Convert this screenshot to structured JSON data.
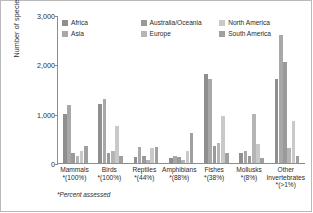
{
  "chart_data": {
    "type": "bar",
    "title": "",
    "xlabel": "",
    "ylabel": "Number of species threatened",
    "ylim": [
      0,
      3000
    ],
    "yticks": [
      "0",
      "1,000",
      "2,000",
      "3,000"
    ],
    "ytick_values": [
      0,
      1000,
      2000,
      3000
    ],
    "grid": false,
    "legend_position": "top-inside",
    "footnote": "*Percent assessed",
    "categories": [
      "Mammals",
      "Birds",
      "Reptiles",
      "Amphibians",
      "Fishes",
      "Mollusks",
      "Other Invertebrates"
    ],
    "category_percents": [
      "*(100%)",
      "*(100%)",
      "*(44%)",
      "*(88%)",
      "*(38%)",
      "*(8%)",
      "*(>1%)"
    ],
    "series": [
      {
        "name": "Africa",
        "color": "#8f8f8f",
        "values": [
          1000,
          1200,
          120,
          110,
          1800,
          210,
          1700
        ]
      },
      {
        "name": "Asia",
        "color": "#a8a8a8",
        "values": [
          1180,
          1300,
          330,
          150,
          1700,
          240,
          2600
        ]
      },
      {
        "name": "Australia/Oceania",
        "color": "#9a9a9a",
        "values": [
          200,
          210,
          140,
          120,
          350,
          150,
          2050
        ]
      },
      {
        "name": "Europe",
        "color": "#b5b5b5",
        "values": [
          150,
          250,
          70,
          60,
          400,
          1000,
          300
        ]
      },
      {
        "name": "North America",
        "color": "#c9c9c9",
        "values": [
          250,
          750,
          300,
          250,
          950,
          380,
          850
        ]
      },
      {
        "name": "South America",
        "color": "#a0a0a0",
        "values": [
          350,
          150,
          320,
          600,
          200,
          100,
          150
        ]
      }
    ]
  },
  "legend": {
    "items": [
      {
        "label": "Africa"
      },
      {
        "label": "Australia/Oceania"
      },
      {
        "label": "North America"
      },
      {
        "label": "Asia"
      },
      {
        "label": "Europe"
      },
      {
        "label": "South America"
      }
    ]
  }
}
